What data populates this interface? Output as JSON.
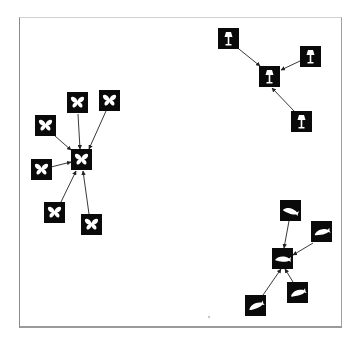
{
  "diagram": {
    "type": "star-clusters",
    "frame": {
      "x": 19,
      "y": 17,
      "width": 323,
      "height": 311
    },
    "colors": {
      "node": "#0a0a0a",
      "glyph": "#ffffff",
      "edge": "#222222",
      "frame": "#9a9a9a",
      "background": "#ffffff"
    },
    "clusters": [
      {
        "name": "lamp",
        "icon": "lamp-icon",
        "center": {
          "id": "lamp-center",
          "x": 259,
          "y": 66,
          "size": 21
        },
        "nodes": [
          {
            "id": "lamp-1",
            "x": 218,
            "y": 28,
            "size": 21
          },
          {
            "id": "lamp-2",
            "x": 300,
            "y": 46,
            "size": 21
          },
          {
            "id": "lamp-3",
            "x": 291,
            "y": 111,
            "size": 21
          }
        ]
      },
      {
        "name": "butterfly",
        "icon": "butterfly-icon",
        "center": {
          "id": "butterfly-center",
          "x": 71,
          "y": 149,
          "size": 21
        },
        "nodes": [
          {
            "id": "butterfly-1",
            "x": 35,
            "y": 115,
            "size": 21
          },
          {
            "id": "butterfly-2",
            "x": 67,
            "y": 92,
            "size": 21
          },
          {
            "id": "butterfly-3",
            "x": 99,
            "y": 90,
            "size": 21
          },
          {
            "id": "butterfly-4",
            "x": 31,
            "y": 159,
            "size": 21
          },
          {
            "id": "butterfly-5",
            "x": 44,
            "y": 202,
            "size": 21
          },
          {
            "id": "butterfly-6",
            "x": 81,
            "y": 214,
            "size": 21
          }
        ]
      },
      {
        "name": "fish",
        "icon": "fish-icon",
        "center": {
          "id": "fish-center",
          "x": 272,
          "y": 248,
          "size": 21
        },
        "nodes": [
          {
            "id": "fish-1",
            "x": 280,
            "y": 200,
            "size": 21
          },
          {
            "id": "fish-2",
            "x": 311,
            "y": 221,
            "size": 21
          },
          {
            "id": "fish-3",
            "x": 245,
            "y": 295,
            "size": 21
          },
          {
            "id": "fish-4",
            "x": 287,
            "y": 282,
            "size": 21
          }
        ]
      }
    ],
    "stray_dot": {
      "x": 209,
      "y": 317
    }
  }
}
